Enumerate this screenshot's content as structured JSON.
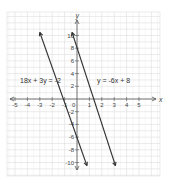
{
  "chart_data": {
    "type": "line",
    "title": "",
    "xlabel": "x",
    "ylabel": "y",
    "xlim": [
      -6,
      6
    ],
    "ylim": [
      -11,
      11
    ],
    "grid": true,
    "x_ticks": [
      "-5",
      "-4",
      "-3",
      "-2",
      "-1",
      "0",
      "1",
      "2",
      "3",
      "4",
      "5"
    ],
    "y_ticks": [
      "10",
      "8",
      "6",
      "4",
      "2",
      "-2",
      "-4",
      "-6",
      "-8",
      "-10"
    ],
    "origin_label": "0",
    "series": [
      {
        "name": "18x + 3y = -2",
        "points": [
          [
            -3,
            10.5
          ],
          [
            0.8,
            -10.5
          ]
        ],
        "color": "#333333"
      },
      {
        "name": "y = -6x + 8",
        "points": [
          [
            -0.4,
            10.5
          ],
          [
            3.1,
            -10.5
          ]
        ],
        "color": "#333333"
      }
    ],
    "annotations": [
      {
        "text": "18x + 3y = -2",
        "x": -4.8,
        "y": 3
      },
      {
        "text": "y = -6x + 8",
        "x": 1.6,
        "y": 3
      }
    ]
  },
  "labels": {
    "eq1": "18x + 3y = -2",
    "eq2": "y = -6x + 8",
    "x_axis": "x",
    "y_axis": "y"
  }
}
